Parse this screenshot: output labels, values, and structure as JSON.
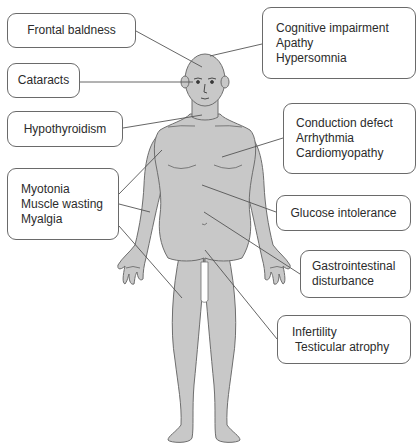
{
  "diagram": {
    "colors": {
      "body_fill": "#c8c8c8",
      "body_stroke": "#6e6e6e",
      "leader_line": "#555555",
      "box_border": "#6a6a6a",
      "text": "#2b2b2b"
    },
    "labels": {
      "frontal_baldness": {
        "lines": [
          "Frontal baldness"
        ]
      },
      "cataracts": {
        "lines": [
          "Cataracts"
        ]
      },
      "hypothyroidism": {
        "lines": [
          "Hypothyroidism"
        ]
      },
      "cognitive": {
        "lines": [
          "Cognitive impairment",
          "Apathy",
          "Hypersomnia"
        ]
      },
      "cardiac": {
        "lines": [
          "Conduction defect",
          "Arrhythmia",
          "Cardiomyopathy"
        ]
      },
      "muscle": {
        "lines": [
          "Myotonia",
          "Muscle wasting",
          "Myalgia"
        ]
      },
      "glucose": {
        "lines": [
          "Glucose intolerance"
        ]
      },
      "gastro": {
        "lines": [
          "Gastrointestinal",
          "disturbance"
        ]
      },
      "reproductive": {
        "lines": [
          "Infertility",
          " Testicular atrophy"
        ]
      }
    }
  }
}
